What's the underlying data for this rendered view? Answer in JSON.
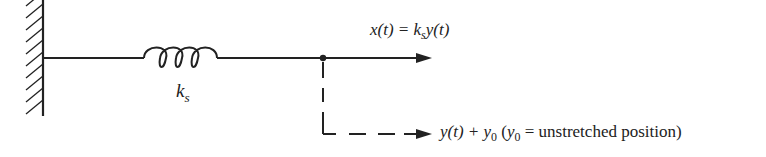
{
  "diagram": {
    "spring": {
      "label_main": "k",
      "label_sub": "s"
    },
    "output_equation": {
      "lhs": "x(t) = ",
      "k": "k",
      "k_sub": "s",
      "rhs": "y(t)"
    },
    "position_label": {
      "expr": "y(t) + ",
      "y0": "y",
      "y0_sub": "0",
      "paren_open": " (",
      "y0b": "y",
      "y0b_sub": "0",
      "note": " = unstretched position)"
    },
    "colors": {
      "line": "#222222",
      "background": "#ffffff"
    }
  }
}
